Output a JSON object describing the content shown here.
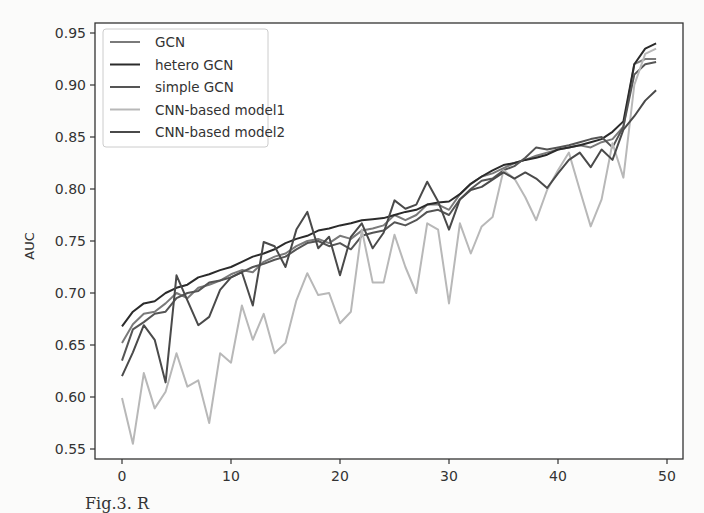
{
  "chart_data": {
    "type": "line",
    "title": "",
    "xlabel": "",
    "ylabel": "AUC",
    "xlim": [
      -1.8,
      51.5
    ],
    "ylim": [
      0.535,
      0.955
    ],
    "xticks": [
      0,
      10,
      20,
      30,
      40,
      50
    ],
    "yticks": [
      0.55,
      0.6,
      0.65,
      0.7,
      0.75,
      0.8,
      0.85,
      0.9,
      0.95
    ],
    "ytick_labels": [
      "0.55",
      "0.60",
      "0.65",
      "0.70",
      "0.75",
      "0.80",
      "0.85",
      "0.90",
      "0.95"
    ],
    "grid": false,
    "legend_position": "upper left",
    "x": [
      0,
      1,
      2,
      3,
      4,
      5,
      6,
      7,
      8,
      9,
      10,
      11,
      12,
      13,
      14,
      15,
      16,
      17,
      18,
      19,
      20,
      21,
      22,
      23,
      24,
      25,
      26,
      27,
      28,
      29,
      30,
      31,
      32,
      33,
      34,
      35,
      36,
      37,
      38,
      39,
      40,
      41,
      42,
      43,
      44,
      45,
      46,
      47,
      48,
      49
    ],
    "series": [
      {
        "name": "GCN",
        "color": "#7a7a7a",
        "values": [
          0.652,
          0.67,
          0.68,
          0.682,
          0.69,
          0.7,
          0.695,
          0.705,
          0.708,
          0.712,
          0.718,
          0.722,
          0.72,
          0.73,
          0.735,
          0.738,
          0.745,
          0.75,
          0.752,
          0.748,
          0.755,
          0.752,
          0.76,
          0.762,
          0.765,
          0.775,
          0.77,
          0.775,
          0.785,
          0.785,
          0.78,
          0.795,
          0.805,
          0.812,
          0.815,
          0.82,
          0.825,
          0.828,
          0.832,
          0.835,
          0.838,
          0.84,
          0.842,
          0.84,
          0.845,
          0.848,
          0.86,
          0.92,
          0.925,
          0.925
        ]
      },
      {
        "name": "hetero GCN",
        "color": "#2b2b2b",
        "values": [
          0.668,
          0.682,
          0.69,
          0.692,
          0.7,
          0.705,
          0.708,
          0.715,
          0.718,
          0.722,
          0.725,
          0.73,
          0.735,
          0.738,
          0.742,
          0.748,
          0.752,
          0.755,
          0.76,
          0.762,
          0.765,
          0.767,
          0.77,
          0.771,
          0.772,
          0.775,
          0.778,
          0.78,
          0.785,
          0.787,
          0.788,
          0.795,
          0.805,
          0.812,
          0.818,
          0.823,
          0.825,
          0.828,
          0.83,
          0.833,
          0.838,
          0.84,
          0.842,
          0.845,
          0.848,
          0.855,
          0.865,
          0.92,
          0.935,
          0.94
        ]
      },
      {
        "name": "simple GCN",
        "color": "#555555",
        "values": [
          0.635,
          0.665,
          0.672,
          0.68,
          0.682,
          0.695,
          0.7,
          0.702,
          0.71,
          0.712,
          0.715,
          0.72,
          0.725,
          0.728,
          0.732,
          0.735,
          0.742,
          0.748,
          0.75,
          0.745,
          0.748,
          0.742,
          0.755,
          0.758,
          0.76,
          0.768,
          0.765,
          0.77,
          0.778,
          0.78,
          0.775,
          0.79,
          0.8,
          0.808,
          0.81,
          0.818,
          0.822,
          0.83,
          0.84,
          0.838,
          0.84,
          0.842,
          0.845,
          0.848,
          0.85,
          0.84,
          0.86,
          0.91,
          0.92,
          0.922
        ]
      },
      {
        "name": "CNN-based model1",
        "color": "#b8b8b8",
        "values": [
          0.599,
          0.555,
          0.623,
          0.589,
          0.605,
          0.642,
          0.61,
          0.616,
          0.575,
          0.642,
          0.633,
          0.688,
          0.655,
          0.68,
          0.642,
          0.652,
          0.693,
          0.719,
          0.698,
          0.7,
          0.671,
          0.682,
          0.761,
          0.71,
          0.71,
          0.756,
          0.725,
          0.7,
          0.767,
          0.761,
          0.69,
          0.767,
          0.738,
          0.764,
          0.773,
          0.818,
          0.81,
          0.792,
          0.77,
          0.799,
          0.818,
          0.835,
          0.799,
          0.764,
          0.79,
          0.844,
          0.811,
          0.9,
          0.93,
          0.935
        ]
      },
      {
        "name": "CNN-based model2",
        "color": "#4a4a4a",
        "values": [
          0.62,
          0.643,
          0.669,
          0.655,
          0.614,
          0.717,
          0.693,
          0.669,
          0.677,
          0.703,
          0.715,
          0.72,
          0.688,
          0.749,
          0.745,
          0.725,
          0.761,
          0.778,
          0.743,
          0.754,
          0.717,
          0.754,
          0.767,
          0.743,
          0.758,
          0.789,
          0.781,
          0.785,
          0.807,
          0.788,
          0.761,
          0.79,
          0.799,
          0.802,
          0.809,
          0.816,
          0.81,
          0.816,
          0.81,
          0.801,
          0.815,
          0.828,
          0.835,
          0.821,
          0.838,
          0.828,
          0.857,
          0.87,
          0.885,
          0.895
        ]
      }
    ]
  },
  "legend": {
    "items": [
      "GCN",
      "hetero GCN",
      "simple GCN",
      "CNN-based model1",
      "CNN-based model2"
    ]
  },
  "axes": {
    "ylabel": "AUC"
  },
  "caption": {
    "text": "Fig.3. R"
  }
}
